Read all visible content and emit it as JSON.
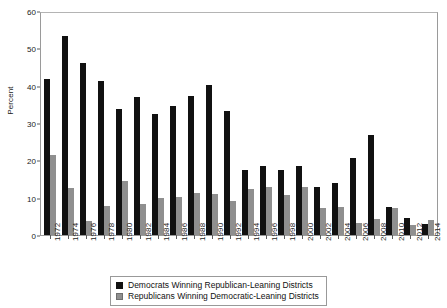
{
  "chart_data": {
    "type": "bar",
    "title": "",
    "xlabel": "",
    "ylabel": "Percent",
    "ylim": [
      0,
      60
    ],
    "yticks": [
      0,
      10,
      20,
      30,
      40,
      50,
      60
    ],
    "grid": false,
    "legend_position": "bottom",
    "categories": [
      "1972",
      "1974",
      "1976",
      "1978",
      "1980",
      "1982",
      "1984",
      "1986",
      "1988",
      "1990",
      "1992",
      "1994",
      "1996",
      "1998",
      "2000",
      "2002",
      "2004",
      "2006",
      "2008",
      "2010",
      "2012",
      "2014"
    ],
    "series": [
      {
        "name": "Democrats Winning Republican-Leaning Districts",
        "color": "#111111",
        "values": [
          42.3,
          53.8,
          46.6,
          41.5,
          34.0,
          37.3,
          32.7,
          34.8,
          37.7,
          40.6,
          33.4,
          17.5,
          18.7,
          17.7,
          18.7,
          13.0,
          14.1,
          20.8,
          26.9,
          7.7,
          4.6,
          3.1
        ]
      },
      {
        "name": "Republicans Winning Democratic-Leaning Districts",
        "color": "#8f8f8f",
        "values": [
          21.5,
          12.7,
          3.9,
          7.9,
          14.6,
          8.3,
          10.0,
          10.4,
          11.3,
          11.0,
          9.3,
          12.4,
          12.9,
          10.8,
          12.9,
          7.2,
          7.7,
          3.2,
          4.4,
          7.2,
          2.8,
          4.1
        ]
      }
    ]
  },
  "legend": {
    "items": [
      {
        "label": "Democrats Winning Republican-Leaning Districts",
        "swatch": "dem"
      },
      {
        "label": "Republicans Winning Democratic-Leaning Districts",
        "swatch": "rep"
      }
    ]
  }
}
